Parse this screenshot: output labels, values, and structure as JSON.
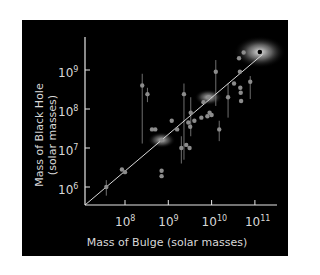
{
  "chart_data": {
    "type": "scatter",
    "title": "",
    "xlabel": "Mass of Bulge (solar masses)",
    "ylabel_line1": "Mass of Black Hole",
    "ylabel_line2": "(solar masses)",
    "xscale": "log",
    "yscale": "log",
    "xlim": [
      12000000.0,
      300000000000.0
    ],
    "ylim": [
      300000.0,
      8000000000.0
    ],
    "grid": false,
    "legend": null,
    "x_ticks": [
      {
        "base": "10",
        "exp": "8"
      },
      {
        "base": "10",
        "exp": "9"
      },
      {
        "base": "10",
        "exp": "10"
      },
      {
        "base": "10",
        "exp": "11"
      }
    ],
    "y_ticks": [
      {
        "base": "10",
        "exp": "6"
      },
      {
        "base": "10",
        "exp": "7"
      },
      {
        "base": "10",
        "exp": "8"
      },
      {
        "base": "10",
        "exp": "9"
      }
    ],
    "fit_line": {
      "x": [
        12000000.0,
        150000000000.0
      ],
      "y": [
        300000.0,
        2500000000.0
      ]
    },
    "points": [
      {
        "x": 37000000.0,
        "y": 1000000.0,
        "err_lo": 600000.0,
        "err_hi": 1500000.0
      },
      {
        "x": 85000000.0,
        "y": 2800000.0
      },
      {
        "x": 100000000.0,
        "y": 2400000.0,
        "highlight": false
      },
      {
        "x": 250000000.0,
        "y": 400000000.0,
        "err_lo": 13000000.0,
        "err_hi": 800000000.0
      },
      {
        "x": 330000000.0,
        "y": 240000000.0,
        "err_lo": 150000000.0,
        "err_hi": 350000000.0
      },
      {
        "x": 420000000.0,
        "y": 30000000.0
      },
      {
        "x": 500000000.0,
        "y": 30000000.0
      },
      {
        "x": 700000000.0,
        "y": 16000000.0,
        "glow": true
      },
      {
        "x": 700000000.0,
        "y": 2600000.0
      },
      {
        "x": 700000000.0,
        "y": 1900000.0
      },
      {
        "x": 1200000000.0,
        "y": 50000000.0
      },
      {
        "x": 1600000000.0,
        "y": 30000000.0
      },
      {
        "x": 2000000000.0,
        "y": 10000000.0,
        "err_lo": 4000000.0,
        "err_hi": 20000000.0
      },
      {
        "x": 2300000000.0,
        "y": 240000000.0,
        "err_lo": 5000000.0,
        "err_hi": 450000000.0
      },
      {
        "x": 2600000000.0,
        "y": 12000000.0
      },
      {
        "x": 2900000000.0,
        "y": 45000000.0
      },
      {
        "x": 3100000000.0,
        "y": 10000000.0
      },
      {
        "x": 3200000000.0,
        "y": 35000000.0
      },
      {
        "x": 3300000000.0,
        "y": 80000000.0,
        "err_lo": 20000000.0,
        "err_hi": 200000000.0
      },
      {
        "x": 4000000000.0,
        "y": 50000000.0
      },
      {
        "x": 5800000000.0,
        "y": 60000000.0
      },
      {
        "x": 6500000000.0,
        "y": 150000000.0
      },
      {
        "x": 8000000000.0,
        "y": 65000000.0
      },
      {
        "x": 8500000000.0,
        "y": 200000000.0,
        "glow": true
      },
      {
        "x": 9000000000.0,
        "y": 80000000.0
      },
      {
        "x": 10000000000.0,
        "y": 70000000.0
      },
      {
        "x": 12500000000.0,
        "y": 900000000.0,
        "err_lo": 120000000.0,
        "err_hi": 1800000000.0
      },
      {
        "x": 15000000000.0,
        "y": 30000000.0,
        "err_lo": 15000000.0,
        "err_hi": 50000000.0
      },
      {
        "x": 24000000000.0,
        "y": 200000000.0,
        "err_lo": 60000000.0,
        "err_hi": 450000000.0
      },
      {
        "x": 33000000000.0,
        "y": 450000000.0
      },
      {
        "x": 43000000000.0,
        "y": 2000000000.0
      },
      {
        "x": 45000000000.0,
        "y": 900000000.0
      },
      {
        "x": 46000000000.0,
        "y": 350000000.0
      },
      {
        "x": 47000000000.0,
        "y": 260000000.0
      },
      {
        "x": 48000000000.0,
        "y": 160000000.0
      },
      {
        "x": 55000000000.0,
        "y": 2800000000.0
      },
      {
        "x": 78000000000.0,
        "y": 500000000.0,
        "err_lo": 180000000.0,
        "err_hi": 700000000.0
      },
      {
        "x": 130000000000.0,
        "y": 2900000000.0,
        "glow": true,
        "large_glow": true,
        "color": "#000000"
      }
    ],
    "colors": {
      "background": "#000000",
      "axis": "#e6e6e6",
      "point": "#8c8c8c",
      "fit_line": "#d9d9d9",
      "text": "#d8d8d8"
    }
  }
}
